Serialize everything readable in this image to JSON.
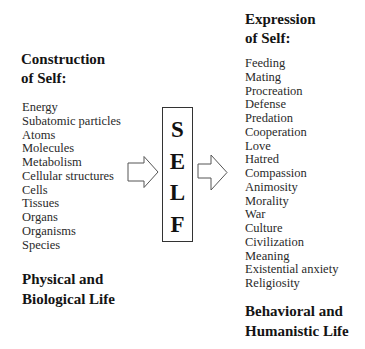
{
  "left_column": {
    "heading": [
      "Construction",
      "of Self:"
    ],
    "items": [
      "Energy",
      "Subatomic particles",
      "Atoms",
      "Molecules",
      "Metabolism",
      "Cellular structures",
      "Cells",
      "Tissues",
      "Organs",
      "Organisms",
      "Species"
    ],
    "footer": [
      "Physical and",
      "Biological Life"
    ]
  },
  "center": {
    "letters": [
      "S",
      "E",
      "L",
      "F"
    ],
    "left_arrow_icon": "hollow-right-arrow",
    "right_arrow_icon": "hollow-right-arrow"
  },
  "right_column": {
    "heading": [
      "Expression",
      "of Self:"
    ],
    "items": [
      "Feeding",
      "Mating",
      "Procreation",
      "Defense",
      "Predation",
      "Cooperation",
      "Love",
      "Hatred",
      "Compassion",
      "Animosity",
      "Morality",
      "War",
      "Culture",
      "Civilization",
      "Meaning",
      "Existential anxiety",
      "Religiosity"
    ],
    "footer": [
      "Behavioral and",
      "Humanistic Life"
    ]
  }
}
